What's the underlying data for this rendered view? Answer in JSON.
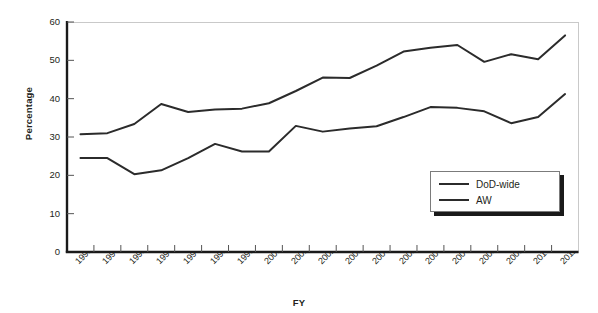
{
  "chart_data": {
    "type": "line",
    "title": "",
    "xlabel": "FY",
    "ylabel": "Percentage",
    "categories": [
      "1993",
      "1994",
      "1995",
      "1996",
      "1997",
      "1998",
      "1999",
      "2000",
      "2001",
      "2002",
      "2003",
      "2004",
      "2005",
      "2006",
      "2007",
      "2008",
      "2009",
      "2010",
      "2011"
    ],
    "yticks": [
      0,
      10,
      20,
      30,
      40,
      50,
      60
    ],
    "ylim": [
      0,
      60
    ],
    "grid": false,
    "legend_position": "bottom-right",
    "series": [
      {
        "name": "DoD-wide",
        "color": "#2b2b2b",
        "values": [
          30.7,
          31.0,
          33.4,
          38.6,
          36.5,
          37.2,
          37.4,
          38.8,
          42.0,
          45.5,
          45.4,
          48.6,
          52.3,
          53.3,
          54.0,
          49.6,
          51.6,
          50.3,
          56.5
        ]
      },
      {
        "name": "AW",
        "color": "#2b2b2b",
        "values": [
          24.5,
          24.5,
          20.3,
          21.3,
          24.5,
          28.2,
          26.2,
          26.2,
          32.9,
          31.4,
          32.2,
          32.8,
          35.2,
          37.8,
          37.6,
          36.7,
          33.6,
          35.2,
          41.2
        ]
      }
    ],
    "legend": [
      {
        "label": "DoD-wide",
        "color": "#2b2b2b"
      },
      {
        "label": "AW",
        "color": "#2b2b2b"
      }
    ]
  },
  "axes": {
    "y_tick_labels": [
      "60",
      "50",
      "40",
      "30",
      "20",
      "10",
      "0"
    ],
    "y_title": "Percentage",
    "x_title": "FY"
  }
}
